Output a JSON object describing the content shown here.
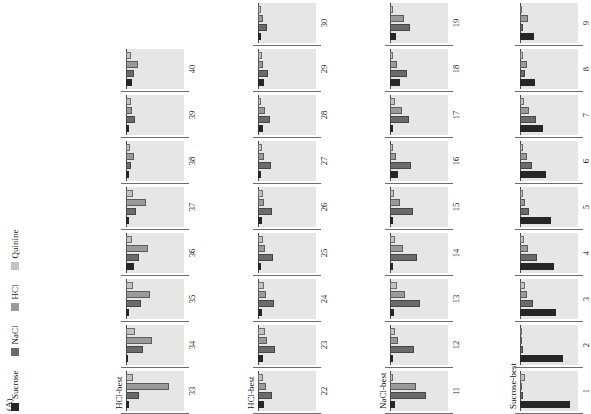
{
  "figure": {
    "panel_letter": "(A)",
    "background": "#e6e6e6",
    "baseline_color": "#4a4a4a"
  },
  "legend": {
    "items": [
      {
        "label": "Sucrose",
        "color": "#262626"
      },
      {
        "label": "NaCl",
        "color": "#6b6b6b"
      },
      {
        "label": "HCl",
        "color": "#9a9a9a"
      },
      {
        "label": "Quinine",
        "color": "#c2c2c2"
      }
    ]
  },
  "chart_data": {
    "type": "bar",
    "title": "(A)",
    "xlabel": "",
    "ylabel": "",
    "grid": false,
    "legend_position": "top-left",
    "orientation": "horizontal",
    "series_order": [
      "Sucrose",
      "NaCl",
      "HCl",
      "Quinine"
    ],
    "series_colors": [
      "#262626",
      "#6b6b6b",
      "#9a9a9a",
      "#c2c2c2"
    ],
    "value_range": [
      0,
      100
    ],
    "rows": [
      {
        "row_label": "Sucrose-best",
        "cells": [
          {
            "id": "1",
            "values": [
              86,
              6,
              2,
              9
            ]
          },
          {
            "id": "2",
            "values": [
              74,
              5,
              2,
              3
            ]
          },
          {
            "id": "3",
            "values": [
              62,
              22,
              12,
              8
            ]
          },
          {
            "id": "4",
            "values": [
              58,
              30,
              14,
              7
            ]
          },
          {
            "id": "5",
            "values": [
              54,
              16,
              9,
              6
            ]
          },
          {
            "id": "6",
            "values": [
              44,
              21,
              12,
              6
            ]
          },
          {
            "id": "7",
            "values": [
              40,
              28,
              16,
              7
            ]
          },
          {
            "id": "8",
            "values": [
              26,
              9,
              12,
              5
            ]
          },
          {
            "id": "9",
            "values": [
              24,
              6,
              14,
              4
            ]
          },
          {
            "id": "10",
            "values": [
              20,
              12,
              6,
              4
            ]
          }
        ]
      },
      {
        "row_label": "NaCl-best",
        "cells": [
          {
            "id": "11",
            "values": [
              8,
              62,
              44,
              5
            ]
          },
          {
            "id": "12",
            "values": [
              6,
              42,
              14,
              8
            ]
          },
          {
            "id": "13",
            "values": [
              7,
              52,
              26,
              12
            ]
          },
          {
            "id": "14",
            "values": [
              6,
              46,
              22,
              9
            ]
          },
          {
            "id": "15",
            "values": [
              5,
              40,
              18,
              7
            ]
          },
          {
            "id": "16",
            "values": [
              14,
              36,
              10,
              5
            ]
          },
          {
            "id": "17",
            "values": [
              6,
              32,
              20,
              8
            ]
          },
          {
            "id": "18",
            "values": [
              18,
              30,
              12,
              6
            ]
          },
          {
            "id": "19",
            "values": [
              10,
              34,
              24,
              6
            ]
          },
          {
            "id": "20",
            "values": [
              5,
              26,
              9,
              5
            ]
          },
          {
            "id": "21",
            "values": [
              12,
              30,
              18,
              5
            ]
          }
        ]
      },
      {
        "row_label": "HCl-best",
        "cells": [
          {
            "id": "22",
            "values": [
              10,
              24,
              14,
              9
            ]
          },
          {
            "id": "23",
            "values": [
              8,
              30,
              16,
              12
            ]
          },
          {
            "id": "24",
            "values": [
              7,
              28,
              14,
              10
            ]
          },
          {
            "id": "25",
            "values": [
              6,
              26,
              12,
              9
            ]
          },
          {
            "id": "26",
            "values": [
              7,
              24,
              11,
              8
            ]
          },
          {
            "id": "27",
            "values": [
              6,
              22,
              10,
              7
            ]
          },
          {
            "id": "28",
            "values": [
              8,
              20,
              12,
              6
            ]
          },
          {
            "id": "29",
            "values": [
              10,
              18,
              9,
              7
            ]
          },
          {
            "id": "30",
            "values": [
              6,
              16,
              8,
              6
            ]
          },
          {
            "id": "31",
            "values": [
              7,
              14,
              7,
              5
            ]
          },
          {
            "id": "32",
            "values": [
              5,
              12,
              6,
              5
            ]
          }
        ]
      },
      {
        "row_label": "HCl-best",
        "cells": [
          {
            "id": "33",
            "values": [
              6,
              22,
              74,
              12
            ]
          },
          {
            "id": "34",
            "values": [
              4,
              30,
              44,
              16
            ]
          },
          {
            "id": "35",
            "values": [
              5,
              26,
              42,
              12
            ]
          },
          {
            "id": "36",
            "values": [
              14,
              22,
              38,
              10
            ]
          },
          {
            "id": "37",
            "values": [
              6,
              18,
              34,
              12
            ]
          },
          {
            "id": "38",
            "values": [
              5,
              9,
              14,
              7
            ]
          },
          {
            "id": "39",
            "values": [
              5,
              16,
              10,
              8
            ]
          },
          {
            "id": "40",
            "values": [
              10,
              14,
              20,
              9
            ]
          }
        ]
      }
    ]
  }
}
